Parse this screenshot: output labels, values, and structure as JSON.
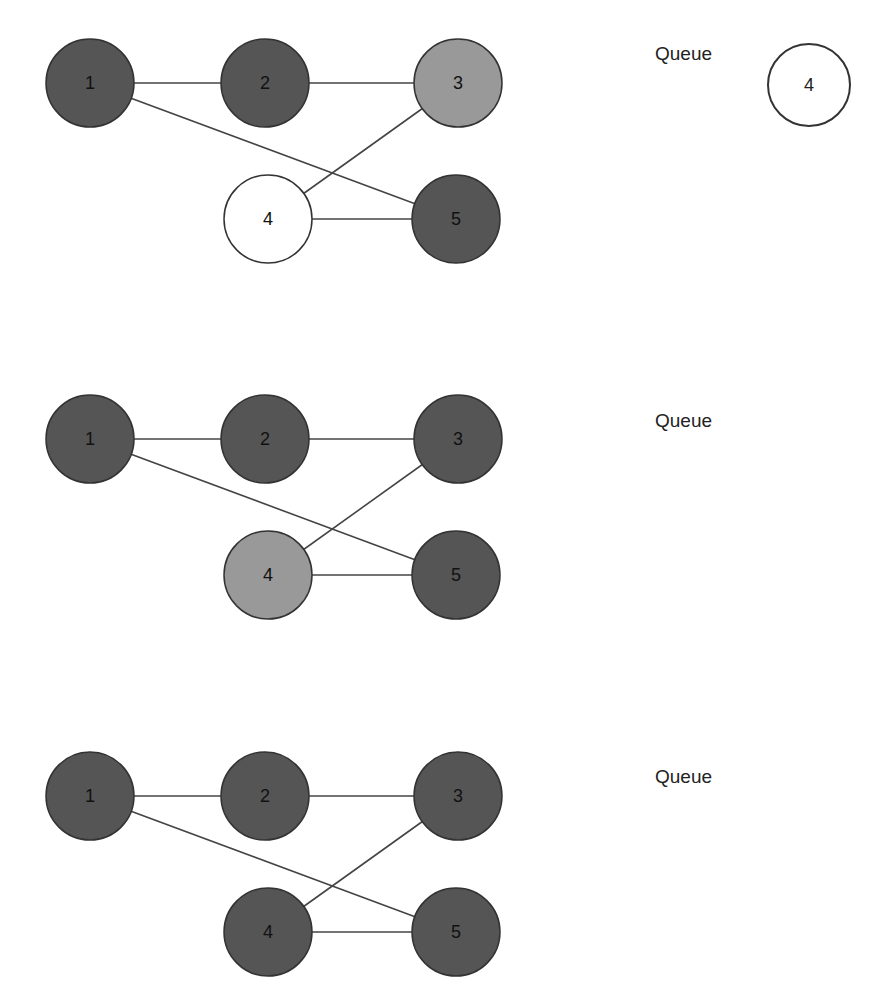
{
  "colors": {
    "visited": "#555555",
    "current": "#999999",
    "queued": "#ffffff",
    "stroke": "#333333",
    "edge": "#444444"
  },
  "graph": {
    "nodes": [
      {
        "id": "1",
        "label": "1",
        "x": 90,
        "y": 83
      },
      {
        "id": "2",
        "label": "2",
        "x": 265,
        "y": 83
      },
      {
        "id": "3",
        "label": "3",
        "x": 458,
        "y": 83
      },
      {
        "id": "4",
        "label": "4",
        "x": 268,
        "y": 219
      },
      {
        "id": "5",
        "label": "5",
        "x": 456,
        "y": 219
      }
    ],
    "edges": [
      [
        "1",
        "2"
      ],
      [
        "2",
        "3"
      ],
      [
        "1",
        "5"
      ],
      [
        "3",
        "4"
      ],
      [
        "4",
        "5"
      ]
    ],
    "radius": 44
  },
  "steps": [
    {
      "offset_y": 0,
      "node_states": {
        "1": "visited",
        "2": "visited",
        "3": "current",
        "4": "queued",
        "5": "visited"
      },
      "queue_label": "Queue",
      "queue": [
        "4"
      ]
    },
    {
      "offset_y": 356,
      "node_states": {
        "1": "visited",
        "2": "visited",
        "3": "visited",
        "4": "current",
        "5": "visited"
      },
      "queue_label": "Queue",
      "queue": []
    },
    {
      "offset_y": 713,
      "node_states": {
        "1": "visited",
        "2": "visited",
        "3": "visited",
        "4": "visited",
        "5": "visited"
      },
      "queue_label": "Queue",
      "queue": []
    }
  ]
}
